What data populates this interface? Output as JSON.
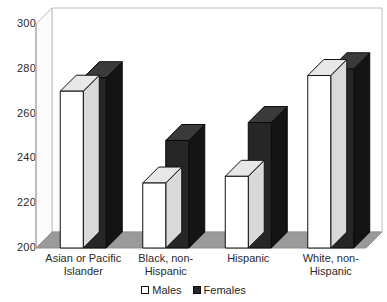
{
  "chart_data": {
    "type": "bar",
    "title": "",
    "subtitle": "",
    "xlabel": "",
    "ylabel": "",
    "ylim": [
      200,
      300
    ],
    "ytick_labels": [
      "300",
      "280",
      "260",
      "240",
      "220",
      "200"
    ],
    "ytick_values": [
      300,
      280,
      260,
      240,
      220,
      200
    ],
    "grid": false,
    "style": "3d-clustered-column",
    "legend_position": "bottom-center",
    "categories": [
      "Asian or Pacific Islander",
      "Black, non-Hispanic",
      "Hispanic",
      "White, non-Hispanic"
    ],
    "category_lines": [
      [
        "Asian or Pacific",
        "Islander"
      ],
      [
        "Black, non-",
        "Hispanic"
      ],
      [
        "Hispanic",
        ""
      ],
      [
        "White, non-",
        "Hispanic"
      ]
    ],
    "series": [
      {
        "name": "Males",
        "color": "#ffffff",
        "edge_color": "#111111",
        "values": [
          270,
          229,
          232,
          277
        ]
      },
      {
        "name": "Females",
        "color": "#262626",
        "edge_color": "#0a0a0a",
        "values": [
          276,
          248,
          256,
          280
        ]
      }
    ]
  },
  "legend": {
    "entries": [
      {
        "label": "Males",
        "swatch": "open-square-swatch"
      },
      {
        "label": "Females",
        "swatch": "filled-square-swatch"
      }
    ]
  },
  "colors": {
    "floor": "#9a9a9a",
    "left_wall": "#f2f2f2",
    "plot_border": "#b8b8b8",
    "bar_males_face": "#ffffff",
    "bar_males_top": "#e8e8e8",
    "bar_females_face": "#262626",
    "bar_females_top": "#3a3a3a",
    "bar_females_side": "#141414",
    "text": "#2a2a2a"
  }
}
